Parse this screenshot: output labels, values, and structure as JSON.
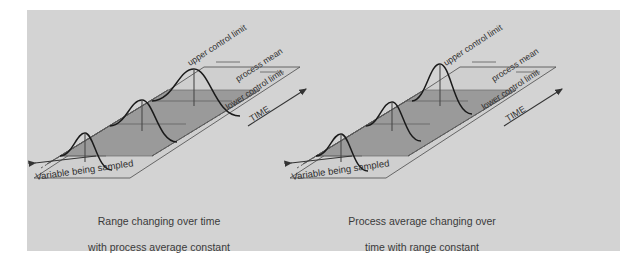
{
  "figure": {
    "type": "diagram",
    "background_color": "#ffffff",
    "panel_color": "#d3d3d3"
  },
  "colors": {
    "panel": "#d3d3d3",
    "band_upper": "#9a9a9a",
    "band_lower": "#b4b4b4",
    "plane_far": "#c2c2c2",
    "curve_stroke": "#1a1a1a",
    "axis_stroke": "#333333",
    "label_text": "#3a3a3a"
  },
  "panels": [
    {
      "id": "left",
      "caption_line1": "Range changing over time",
      "caption_line2": "with process average constant",
      "labels": {
        "upper_control_limit": "upper control limit",
        "process_mean": "process mean",
        "lower_control_limit": "lower control limit",
        "time_axis": "TIME",
        "variable_axis": "Variable being sampled"
      },
      "distributions": [
        {
          "index": 1,
          "spread": "narrow",
          "center": "on-mean"
        },
        {
          "index": 2,
          "spread": "medium",
          "center": "on-mean"
        },
        {
          "index": 3,
          "spread": "wide",
          "center": "on-mean"
        }
      ],
      "description": "Process average stays centred on the mean while the spread of the sampling distribution widens as time increases."
    },
    {
      "id": "right",
      "caption_line1": "Process average changing over",
      "caption_line2": "time with range constant",
      "labels": {
        "upper_control_limit": "upper control limit",
        "process_mean": "process mean",
        "lower_control_limit": "lower control limit",
        "time_axis": "TIME",
        "variable_axis": "Variable being sampled"
      },
      "distributions": [
        {
          "index": 1,
          "spread": "constant",
          "center": "below-mean"
        },
        {
          "index": 2,
          "spread": "constant",
          "center": "near-mean"
        },
        {
          "index": 3,
          "spread": "constant",
          "center": "above-mean"
        }
      ],
      "description": "Spread of the sampling distribution stays constant while the process average drifts upward over time."
    }
  ]
}
